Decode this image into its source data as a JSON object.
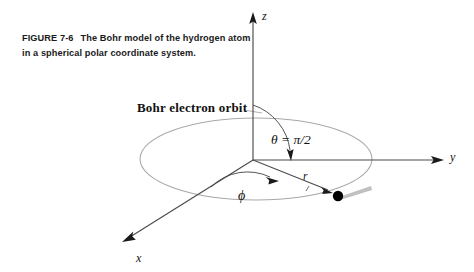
{
  "figure": {
    "caption_number": "FIGURE 7-6",
    "caption_text": "The Bohr model of the hydrogen atom in a spherical polar coordinate system.",
    "background_color": "#ffffff",
    "axis_color": "#4a4a4a",
    "orbit_color": "#a8a8a8",
    "electron_color": "#000000",
    "trail_color": "#b5b5b5"
  },
  "axes": {
    "z_label": "z",
    "y_label": "y",
    "x_label": "x",
    "origin": {
      "x": 253,
      "y": 160
    }
  },
  "annotations": {
    "orbit_label": "Bohr electron orbit",
    "theta_label": "θ = π/2",
    "phi_label": "ϕ",
    "radius_label": "r"
  },
  "electron": {
    "position": {
      "x": 338,
      "y": 196
    },
    "radius": 5.2
  },
  "orbit": {
    "center": {
      "x": 256,
      "y": 159
    },
    "rx": 116,
    "ry": 41
  }
}
